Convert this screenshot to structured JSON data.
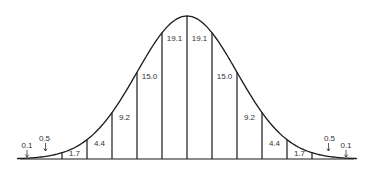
{
  "chart_data": {
    "type": "area",
    "title": "",
    "xlabel": "",
    "ylabel": "",
    "distribution": {
      "mean": 0,
      "sd": 1
    },
    "band_width_sd": 0.5,
    "x_range_sd": [
      -3.4,
      3.4
    ],
    "divider_positions_sd": [
      -2.5,
      -2.0,
      -1.5,
      -1.0,
      -0.5,
      0.0,
      0.5,
      1.0,
      1.5,
      2.0,
      2.5
    ],
    "bands": [
      {
        "range_sd": [
          -3.0,
          -2.5
        ],
        "value": 0.5,
        "label": "0.5",
        "style": "arrow"
      },
      {
        "range_sd": [
          -2.5,
          -2.0
        ],
        "value": 1.7,
        "label": "1.7",
        "style": "inside"
      },
      {
        "range_sd": [
          -2.0,
          -1.5
        ],
        "value": 4.4,
        "label": "4.4",
        "style": "inside"
      },
      {
        "range_sd": [
          -1.5,
          -1.0
        ],
        "value": 9.2,
        "label": "9.2",
        "style": "inside"
      },
      {
        "range_sd": [
          -1.0,
          -0.5
        ],
        "value": 15.0,
        "label": "15.0",
        "style": "inside"
      },
      {
        "range_sd": [
          -0.5,
          0.0
        ],
        "value": 19.1,
        "label": "19.1",
        "style": "inside"
      },
      {
        "range_sd": [
          0.0,
          0.5
        ],
        "value": 19.1,
        "label": "19.1",
        "style": "inside"
      },
      {
        "range_sd": [
          0.5,
          1.0
        ],
        "value": 15.0,
        "label": "15.0",
        "style": "inside"
      },
      {
        "range_sd": [
          1.0,
          1.5
        ],
        "value": 9.2,
        "label": "9.2",
        "style": "inside"
      },
      {
        "range_sd": [
          1.5,
          2.0
        ],
        "value": 4.4,
        "label": "4.4",
        "style": "inside"
      },
      {
        "range_sd": [
          2.0,
          2.5
        ],
        "value": 1.7,
        "label": "1.7",
        "style": "inside"
      },
      {
        "range_sd": [
          2.5,
          3.0
        ],
        "value": 0.5,
        "label": "0.5",
        "style": "arrow"
      }
    ],
    "tails": [
      {
        "side": "left",
        "value": 0.1,
        "label": "0.1"
      },
      {
        "side": "right",
        "value": 0.1,
        "label": "0.1"
      }
    ],
    "colors": {
      "line": "#1a1a1a",
      "text": "#333333",
      "background": "#ffffff"
    }
  }
}
